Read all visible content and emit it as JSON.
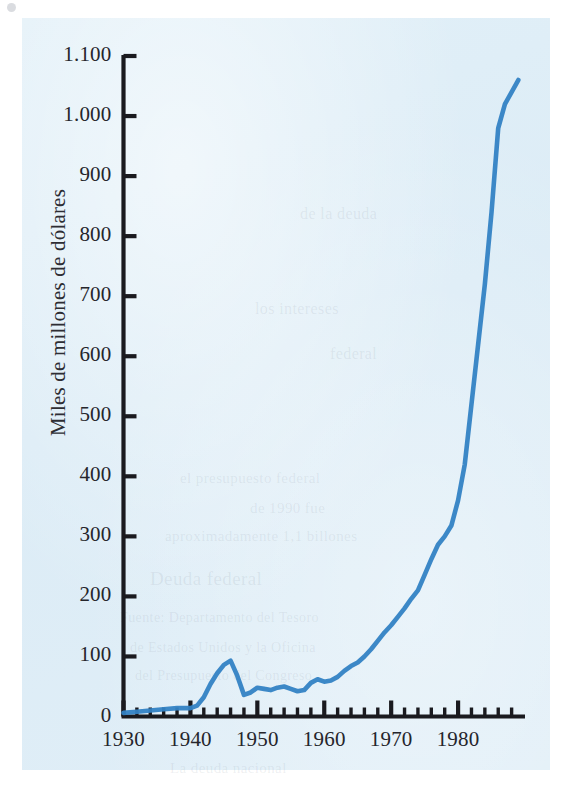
{
  "figure": {
    "axis_color": "#1a1a1f",
    "line_color": "#3382c4",
    "background_color": "#dfeef7",
    "page_color": "#ffffff"
  },
  "bleed_text": [
    {
      "text": "de la deuda",
      "x": 300,
      "y": 205,
      "size": 16
    },
    {
      "text": "los intereses",
      "x": 255,
      "y": 300,
      "size": 16
    },
    {
      "text": "federal",
      "x": 330,
      "y": 345,
      "size": 16
    },
    {
      "text": "el presupuesto federal",
      "x": 180,
      "y": 470,
      "size": 15
    },
    {
      "text": "de 1990 fue",
      "x": 250,
      "y": 500,
      "size": 15
    },
    {
      "text": "aproximadamente 1,1 billones",
      "x": 165,
      "y": 528,
      "size": 15
    },
    {
      "text": "Deuda federal",
      "x": 150,
      "y": 568,
      "size": 19
    },
    {
      "text": "Fuente: Departamento del Tesoro",
      "x": 120,
      "y": 610,
      "size": 14
    },
    {
      "text": "de Estados Unidos y la Oficina",
      "x": 130,
      "y": 640,
      "size": 14
    },
    {
      "text": "del Presupuesto del Congreso",
      "x": 135,
      "y": 668,
      "size": 14
    },
    {
      "text": "La deuda nacional",
      "x": 170,
      "y": 760,
      "size": 15
    }
  ],
  "chart_data": {
    "type": "line",
    "title": "",
    "subtitle": "",
    "xlabel": "",
    "ylabel": "Miles de millones de dólares",
    "xlim": [
      1930,
      1990
    ],
    "ylim": [
      0,
      1100
    ],
    "grid": false,
    "legend": null,
    "y_ticks": [
      0,
      100,
      200,
      300,
      400,
      500,
      600,
      700,
      800,
      900,
      1000,
      1100
    ],
    "y_tick_labels": [
      "0",
      "100",
      "200",
      "300",
      "400",
      "500",
      "600",
      "700",
      "800",
      "900",
      "1.000",
      "1.100"
    ],
    "x_ticks": [
      1930,
      1940,
      1950,
      1960,
      1970,
      1980
    ],
    "x_tick_labels": [
      "1930",
      "1940",
      "1950",
      "1960",
      "1970",
      "1980"
    ],
    "x_minor_tick_step": 2,
    "series": [
      {
        "name": "Deuda federal",
        "color": "#3382c4",
        "x": [
          1930,
          1932,
          1934,
          1936,
          1938,
          1940,
          1941,
          1942,
          1943,
          1944,
          1945,
          1946,
          1947,
          1948,
          1949,
          1950,
          1951,
          1952,
          1953,
          1954,
          1955,
          1956,
          1957,
          1958,
          1959,
          1960,
          1961,
          1962,
          1963,
          1964,
          1965,
          1966,
          1967,
          1968,
          1969,
          1970,
          1971,
          1972,
          1973,
          1974,
          1975,
          1976,
          1977,
          1978,
          1979,
          1980,
          1981,
          1982,
          1983,
          1984,
          1985,
          1986,
          1987,
          1988,
          1989
        ],
        "y": [
          6,
          8,
          10,
          12,
          14,
          14,
          18,
          32,
          54,
          72,
          86,
          93,
          68,
          36,
          40,
          48,
          46,
          44,
          48,
          50,
          46,
          42,
          44,
          56,
          62,
          58,
          60,
          66,
          76,
          84,
          90,
          100,
          112,
          126,
          140,
          152,
          166,
          180,
          196,
          210,
          236,
          262,
          286,
          300,
          318,
          360,
          420,
          520,
          620,
          720,
          840,
          980,
          1020,
          1040,
          1060
        ]
      }
    ]
  }
}
